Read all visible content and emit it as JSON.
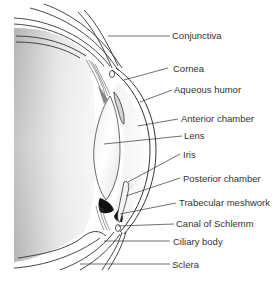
{
  "diagram": {
    "labels": [
      {
        "id": "conjunctiva",
        "text": "Conjunctiva",
        "x": 172,
        "y": 30
      },
      {
        "id": "cornea",
        "text": "Cornea",
        "x": 173,
        "y": 63
      },
      {
        "id": "aqueous-humor",
        "text": "Aqueous humor",
        "x": 174,
        "y": 84
      },
      {
        "id": "anterior-chamber",
        "text": "Anterior chamber",
        "x": 181,
        "y": 113
      },
      {
        "id": "lens",
        "text": "Lens",
        "x": 184,
        "y": 130
      },
      {
        "id": "iris",
        "text": "Iris",
        "x": 183,
        "y": 149
      },
      {
        "id": "posterior-chamber",
        "text": "Posterior chamber",
        "x": 183,
        "y": 173
      },
      {
        "id": "trabecular-meshwork",
        "text": "Trabecular meshwork",
        "x": 179,
        "y": 197
      },
      {
        "id": "canal-of-schlemm",
        "text": "Canal of Schlemm",
        "x": 176,
        "y": 218
      },
      {
        "id": "ciliary-body",
        "text": "Ciliary body",
        "x": 173,
        "y": 236
      },
      {
        "id": "sclera",
        "text": "Sclera",
        "x": 172,
        "y": 259
      }
    ],
    "colors": {
      "line": "#333333",
      "text": "#333333",
      "vitreous_gradient_dark": "#b8b8b8",
      "vitreous_gradient_light": "#f4f4f4",
      "pigment": "#111111"
    }
  }
}
